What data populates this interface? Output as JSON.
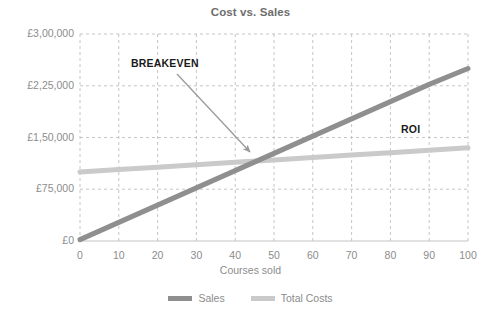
{
  "chart_data": {
    "type": "line",
    "title": "Cost vs. Sales",
    "xlabel": "Courses sold",
    "ylabel": "",
    "x": [
      0,
      10,
      20,
      30,
      40,
      50,
      60,
      70,
      80,
      90,
      100
    ],
    "xlim": [
      0,
      100
    ],
    "ylim": [
      0,
      300000
    ],
    "xticks": [
      "0",
      "10",
      "20",
      "30",
      "40",
      "50",
      "60",
      "70",
      "80",
      "90",
      "100"
    ],
    "yticks": [
      "£0",
      "£75,000",
      "£1,50,000",
      "£2,25,000",
      "£3,00,000"
    ],
    "ytick_values": [
      0,
      75000,
      150000,
      225000,
      300000
    ],
    "grid": true,
    "grid_style": "dashed",
    "legend_position": "bottom",
    "series": [
      {
        "name": "Sales",
        "color": "#8f8f8f",
        "values": [
          2000,
          27000,
          52000,
          77000,
          102000,
          127000,
          152000,
          177000,
          202000,
          227000,
          250000
        ]
      },
      {
        "name": "Total Costs",
        "color": "#cacaca",
        "values": [
          100000,
          103500,
          107000,
          110500,
          114000,
          117500,
          121000,
          124500,
          128000,
          131500,
          135000
        ]
      }
    ],
    "annotations": [
      {
        "label": "BREAKEVEN",
        "kind": "arrow-callout",
        "x": 46,
        "y": 117000,
        "note": "intersection of Sales and Total Costs"
      },
      {
        "label": "ROI",
        "kind": "text",
        "x": 84,
        "y": 160000,
        "note": "gap between Sales and Total Costs"
      }
    ]
  },
  "legend": {
    "items": [
      {
        "label": "Sales",
        "color": "#8f8f8f"
      },
      {
        "label": "Total Costs",
        "color": "#cacaca"
      }
    ]
  },
  "colors": {
    "sales": "#8f8f8f",
    "total_costs": "#cacaca",
    "grid": "#bfbfbf",
    "axis_text": "#8c8c8c",
    "title_text": "#6e6e6e",
    "annotation_text": "#1a1a1a",
    "arrow": "#9a9a9a",
    "background": "#ffffff"
  }
}
